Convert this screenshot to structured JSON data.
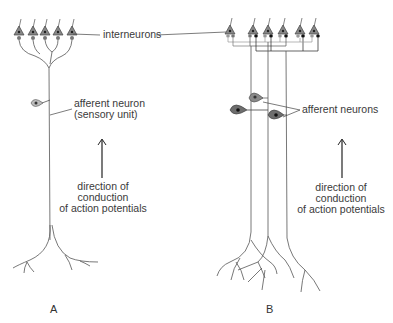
{
  "labels": {
    "interneurons": "interneurons",
    "afferent_neuron_line1": "afferent neuron",
    "afferent_neuron_line2": "(sensory unit)",
    "afferent_neurons": "afferent neurons",
    "direction_A": [
      "direction of",
      "conduction",
      "of action potentials"
    ],
    "direction_B": [
      "direction of",
      "conduction",
      "of action potentials"
    ]
  },
  "panels": [
    {
      "letter": "A",
      "interneuron_count": 5,
      "afferent_count": 1
    },
    {
      "letter": "B",
      "interneuron_count": 6,
      "afferent_count": 3
    }
  ],
  "colors": {
    "line": "#555555",
    "soma_light": "#9a9a9a",
    "soma_dark": "#6a6a6a",
    "nucleus": "#222222",
    "arrow": "#222222"
  }
}
